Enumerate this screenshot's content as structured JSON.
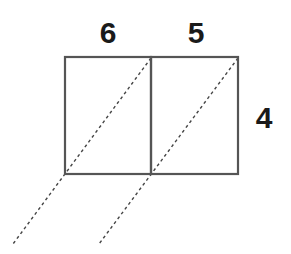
{
  "diagram": {
    "type": "lattice-multiplication",
    "top_digits": [
      "6",
      "5"
    ],
    "right_digits": [
      "4"
    ],
    "colors": {
      "box_stroke": "#555555",
      "diagonal": "#444444",
      "text": "#1a1a1a"
    }
  }
}
